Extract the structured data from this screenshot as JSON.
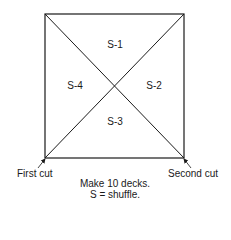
{
  "diagram": {
    "sections": [
      {
        "label": "S-1",
        "position": "top"
      },
      {
        "label": "S-2",
        "position": "right"
      },
      {
        "label": "S-3",
        "position": "bottom"
      },
      {
        "label": "S-4",
        "position": "left"
      }
    ],
    "corners": {
      "bottom_left": "First cut",
      "bottom_right": "Second cut"
    },
    "caption": {
      "line1": "Make 10 decks.",
      "line2": "S = shuffle."
    },
    "colors": {
      "line": "#1a1a1a",
      "background": "#ffffff"
    }
  }
}
